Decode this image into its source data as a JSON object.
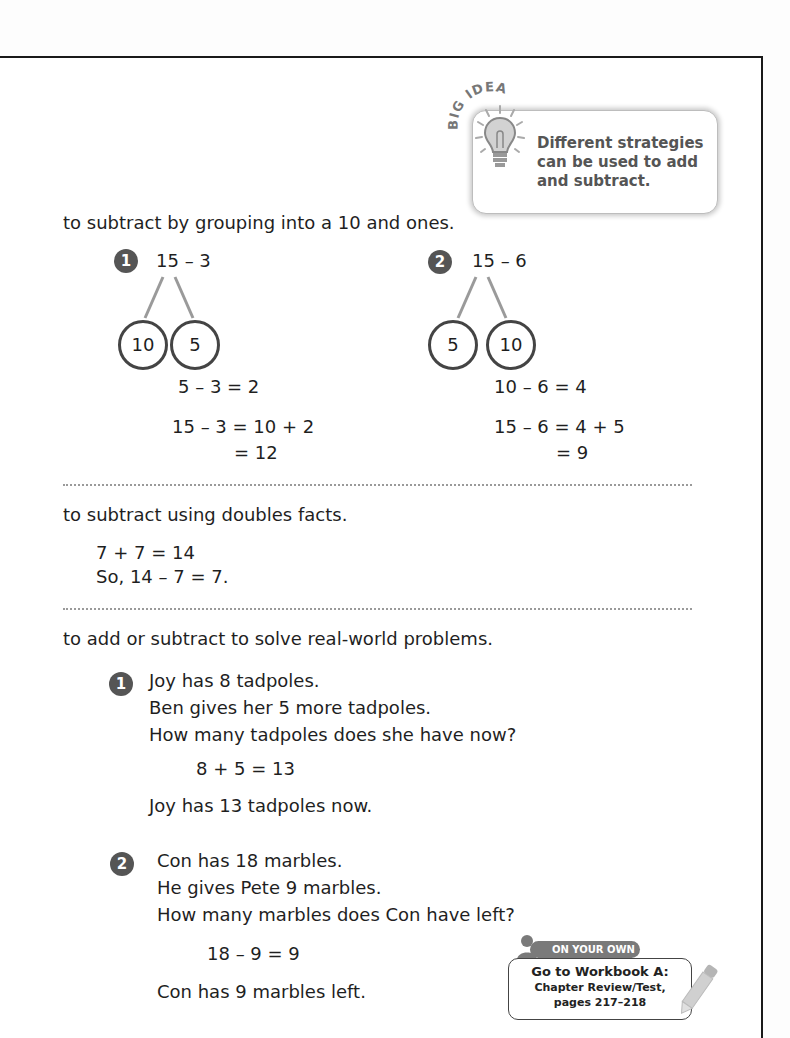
{
  "big_idea": {
    "label": "BIG IDEA",
    "text": "Different strategies can be used to add and subtract.",
    "icon": "lightbulb-icon"
  },
  "section1": {
    "heading": "to subtract by grouping into a 10 and ones.",
    "examples": [
      {
        "number": "1",
        "expression": "15 – 3",
        "bond_left": "10",
        "bond_right": "5",
        "step1": "5 – 3 = 2",
        "step2": "15 – 3 = 10 + 2",
        "step3": "= 12"
      },
      {
        "number": "2",
        "expression": "15 – 6",
        "bond_left": "5",
        "bond_right": "10",
        "step1": "10 – 6 = 4",
        "step2": "15 – 6 = 4 + 5",
        "step3": "= 9"
      }
    ]
  },
  "section2": {
    "heading": "to subtract using doubles facts.",
    "line1": "7 + 7 = 14",
    "line2": "So, 14 – 7 = 7."
  },
  "section3": {
    "heading": "to add or subtract to solve real-world problems.",
    "problems": [
      {
        "number": "1",
        "lines": [
          "Joy has 8 tadpoles.",
          "Ben gives her 5 more tadpoles.",
          "How many tadpoles does she have now?"
        ],
        "equation": "8 + 5 = 13",
        "answer": "Joy has 13 tadpoles now."
      },
      {
        "number": "2",
        "lines": [
          "Con has 18 marbles.",
          "He gives Pete 9 marbles.",
          "How many marbles does Con have left?"
        ],
        "equation": "18 – 9 = 9",
        "answer": "Con has 9 marbles left."
      }
    ]
  },
  "on_your_own": {
    "tab_label": "ON YOUR OWN",
    "line1": "Go to Workbook A:",
    "line2": "Chapter Review/Test,",
    "line3": "pages 217–218",
    "icon": "pencil-icon"
  }
}
